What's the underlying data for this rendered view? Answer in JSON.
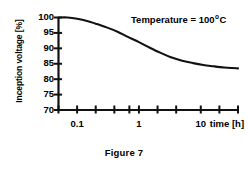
{
  "figure": {
    "caption": "Figure  7",
    "annotation_prefix": "Temperature = 100",
    "annotation_degree": "o",
    "annotation_unit": "C"
  },
  "chart_data": {
    "type": "line",
    "title": "",
    "subtitle": "",
    "xlabel": "time [h]",
    "ylabel": "Inception voltage [%]",
    "xscale": "log",
    "yscale": "linear",
    "xlim": [
      0.05,
      40
    ],
    "ylim": [
      70,
      100
    ],
    "grid": false,
    "legend": null,
    "annotations": [
      {
        "text": "Temperature = 100 o C",
        "x": 1.6,
        "y": 99
      }
    ],
    "xticks": [
      0.05,
      0.1,
      0.2,
      0.4,
      0.7,
      1,
      2,
      4,
      10,
      20,
      40
    ],
    "xtick_labels": [
      "",
      "0.1",
      "",
      "",
      "",
      "1",
      "",
      "",
      "10",
      "",
      ""
    ],
    "yticks": [
      70,
      75,
      80,
      85,
      90,
      95,
      100
    ],
    "ytick_labels": [
      "70",
      "75",
      "80",
      "85",
      "90",
      "95",
      "100"
    ],
    "series": [
      {
        "name": "Inception voltage",
        "x": [
          0.05,
          0.07,
          0.1,
          0.15,
          0.2,
          0.3,
          0.45,
          0.65,
          1.0,
          1.5,
          2.2,
          3.2,
          5.0,
          7.5,
          11.0,
          16.0,
          24.0,
          32.0,
          40.0
        ],
        "values": [
          100.0,
          100.0,
          99.6,
          98.8,
          98.0,
          96.8,
          95.4,
          93.8,
          92.0,
          90.2,
          88.6,
          87.2,
          86.0,
          85.2,
          84.6,
          84.2,
          83.8,
          83.6,
          83.5
        ]
      }
    ]
  },
  "axis": {
    "y_title": "Inception voltage [%]",
    "x_title": "time [h]"
  }
}
